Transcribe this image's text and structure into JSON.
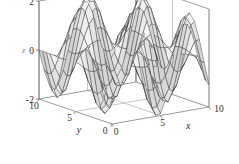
{
  "figure": {
    "name": "3d-surface-plot",
    "background_color": "#ffffff",
    "axis_color": "#6e6e6e",
    "grid_color": "#9b9b9b",
    "mesh_color": "#2e2e2e"
  },
  "chart_data": {
    "type": "surface",
    "title": "",
    "xlabel": "x",
    "ylabel": "y",
    "zlabel": "z",
    "xlim": [
      0,
      10
    ],
    "ylim": [
      0,
      10
    ],
    "zlim": [
      -2,
      2
    ],
    "xticks": [
      0,
      5,
      10
    ],
    "yticks": [
      0,
      5,
      10
    ],
    "zticks": [
      -2,
      0,
      2
    ],
    "xticklabels": [
      "0",
      "5",
      "10"
    ],
    "yticklabels": [
      "0",
      "5",
      "10"
    ],
    "zticklabels": [
      "-2",
      "0",
      "2"
    ],
    "grid": true,
    "legend": false,
    "colormap": "gray",
    "shading": "faceted",
    "mesh_n": 20,
    "surface_expression": "sin(x) * cos(y)",
    "amplitude": 2.0,
    "view_azimuth": -37.5,
    "view_elevation": 30,
    "z_range_observed": [
      -2,
      2
    ],
    "x_samples": [
      0,
      0.526,
      1.053,
      1.579,
      2.105,
      2.632,
      3.158,
      3.684,
      4.211,
      4.737,
      5.263,
      5.789,
      6.316,
      6.842,
      7.368,
      7.895,
      8.421,
      8.947,
      9.474,
      10
    ],
    "y_samples": [
      0,
      0.526,
      1.053,
      1.579,
      2.105,
      2.632,
      3.158,
      3.684,
      4.211,
      4.737,
      5.263,
      5.789,
      6.316,
      6.842,
      7.368,
      7.895,
      8.421,
      8.947,
      9.474,
      10
    ]
  },
  "axes": {
    "z": {
      "label": "z",
      "ticks": [
        {
          "value": 2,
          "label": "2"
        },
        {
          "value": 0,
          "label": "0"
        },
        {
          "value": -2,
          "label": "-2"
        }
      ]
    },
    "y": {
      "label": "y",
      "ticks": [
        {
          "value": 10,
          "label": "10"
        },
        {
          "value": 5,
          "label": "5"
        },
        {
          "value": 0,
          "label": "0"
        }
      ]
    },
    "x": {
      "label": "x",
      "ticks": [
        {
          "value": 0,
          "label": "0"
        },
        {
          "value": 5,
          "label": "5"
        },
        {
          "value": 10,
          "label": "10"
        }
      ]
    }
  }
}
